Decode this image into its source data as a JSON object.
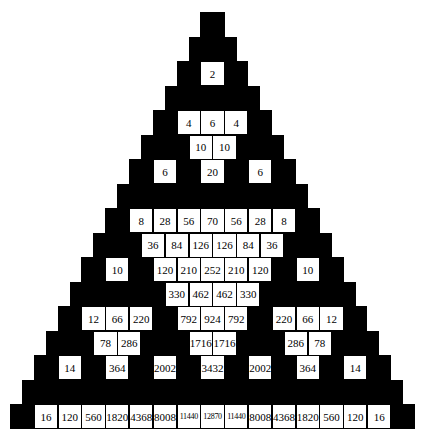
{
  "rows": 17,
  "layout": {
    "left": 10,
    "top": 12,
    "cell_w": 23.8,
    "cell_h": 24.5
  },
  "colors": {
    "odd": "#000000",
    "even": "#ffffff",
    "text": "#000000"
  },
  "bottom_row": [
    16,
    120,
    560,
    1820,
    4368,
    8008,
    11440,
    12870,
    11440,
    8008,
    4368,
    1820,
    560,
    120,
    16
  ]
}
